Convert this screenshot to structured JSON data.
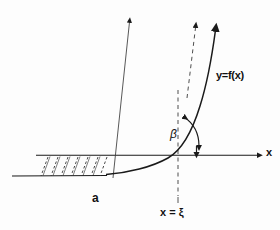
{
  "figure": {
    "background_color": "#fdfdfd",
    "ink_color": "#1a1a1a"
  },
  "labels": {
    "curve_function": "y=f(x)",
    "axis_x": "x",
    "interval_start": "a",
    "vertical_line": "x = ξ",
    "angle": "β"
  },
  "geometry": {
    "x_axis": {
      "y": 155,
      "x_start": 36,
      "x_end": 262,
      "arrow": "right"
    },
    "lower_horizontal": {
      "y": 176,
      "x_start": 12,
      "x_end": 106
    },
    "curve": {
      "crosses_axis_at_x": 178,
      "start_x": 106,
      "end_x": 218,
      "arrow": "up"
    },
    "tangent_dashed_arrow": {
      "from": [
        188,
        96
      ],
      "to": [
        196,
        20
      ],
      "arrow": "up"
    },
    "vertical_dashed_line": {
      "x": 178,
      "y_top": 90,
      "y_bottom": 196
    },
    "normal_line": {
      "from": [
        113,
        178
      ],
      "to": [
        130,
        14
      ],
      "arrow": "up"
    },
    "hatch_count": 7,
    "hatch_x_start": 48,
    "hatch_x_end": 106,
    "angle_arc": {
      "center": [
        178,
        155
      ],
      "double_headed": true
    }
  }
}
